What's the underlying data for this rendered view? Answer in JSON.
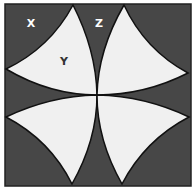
{
  "figure": {
    "labels": {
      "x": "X",
      "y": "Y",
      "z": "Z"
    },
    "colors": {
      "dark_region": "#474747",
      "light_region": "#f0f0f0",
      "outline": "#111111",
      "dark_label": "#ffffff",
      "light_label": "#333333"
    }
  }
}
